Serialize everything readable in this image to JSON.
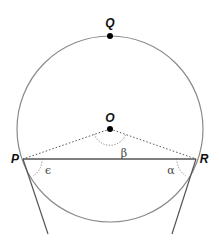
{
  "diagram": {
    "type": "circle-geometry",
    "colors": {
      "circle": "#8a8a8a",
      "chord": "#555555",
      "radius_dotted": "#555555",
      "tangent": "#555555",
      "angle_arc": "#777777",
      "point": "#000000"
    },
    "points": {
      "Q": {
        "label": "Q",
        "x": 110,
        "y": 36
      },
      "O": {
        "label": "O",
        "x": 110,
        "y": 129
      },
      "P": {
        "label": "P",
        "x": 23,
        "y": 159
      },
      "R": {
        "label": "R",
        "x": 196,
        "y": 159
      }
    },
    "angles": {
      "beta": {
        "label": "β",
        "vertex": "O"
      },
      "epsilon": {
        "label": "ϵ",
        "vertex": "P"
      },
      "alpha": {
        "label": "α",
        "vertex": "R"
      }
    },
    "circle": {
      "cx": 110,
      "cy": 129,
      "r": 93
    }
  }
}
